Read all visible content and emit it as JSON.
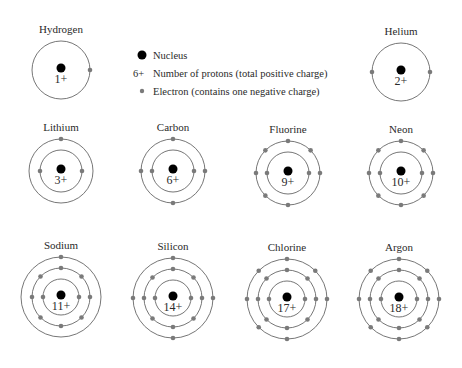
{
  "legend": {
    "items": [
      {
        "symbol": "nucleus",
        "text": "Nucleus"
      },
      {
        "symbol": "6+",
        "text": "Number of protons (total positive charge)"
      },
      {
        "symbol": "electron",
        "text": "Electron (contains one negative charge)"
      }
    ]
  },
  "colors": {
    "nucleus": "#000000",
    "electron": "#7a7a7a",
    "shell": "#666666",
    "text": "#2a2a2a"
  },
  "atoms": [
    {
      "name": "Hydrogen",
      "charge": "1+",
      "cx": 61,
      "cy": 70,
      "shells": [
        {
          "r": 29,
          "angles": [
            0
          ]
        }
      ]
    },
    {
      "name": "Helium",
      "charge": "2+",
      "cx": 401,
      "cy": 72,
      "shells": [
        {
          "r": 29,
          "angles": [
            0,
            180
          ]
        }
      ]
    },
    {
      "name": "Lithium",
      "charge": "3+",
      "cx": 61,
      "cy": 171,
      "shells": [
        {
          "r": 21,
          "angles": [
            0,
            180
          ]
        },
        {
          "r": 32,
          "angles": [
            270
          ]
        }
      ]
    },
    {
      "name": "Carbon",
      "charge": "6+",
      "cx": 173,
      "cy": 171,
      "shells": [
        {
          "r": 21,
          "angles": [
            0,
            180
          ]
        },
        {
          "r": 32,
          "angles": [
            0,
            90,
            180,
            270
          ]
        }
      ]
    },
    {
      "name": "Fluorine",
      "charge": "9+",
      "cx": 288,
      "cy": 173,
      "shells": [
        {
          "r": 21,
          "angles": [
            0,
            180
          ]
        },
        {
          "r": 32,
          "angles": [
            0,
            90,
            135,
            180,
            225,
            270,
            315
          ]
        }
      ]
    },
    {
      "name": "Neon",
      "charge": "10+",
      "cx": 401,
      "cy": 173,
      "shells": [
        {
          "r": 21,
          "angles": [
            0,
            180
          ]
        },
        {
          "r": 32,
          "angles": [
            0,
            45,
            90,
            135,
            180,
            225,
            270,
            315
          ]
        }
      ]
    },
    {
      "name": "Sodium",
      "charge": "11+",
      "cx": 61,
      "cy": 297,
      "shells": [
        {
          "r": 18,
          "angles": [
            0,
            180
          ]
        },
        {
          "r": 29,
          "angles": [
            0,
            45,
            90,
            135,
            180,
            225,
            270,
            315
          ]
        },
        {
          "r": 40,
          "angles": [
            270
          ]
        }
      ]
    },
    {
      "name": "Silicon",
      "charge": "14+",
      "cx": 173,
      "cy": 298,
      "shells": [
        {
          "r": 18,
          "angles": [
            0,
            180
          ]
        },
        {
          "r": 29,
          "angles": [
            0,
            45,
            90,
            135,
            180,
            225,
            270,
            315
          ]
        },
        {
          "r": 40,
          "angles": [
            0,
            90,
            180,
            270
          ]
        }
      ]
    },
    {
      "name": "Chlorine",
      "charge": "17+",
      "cx": 287,
      "cy": 299,
      "shells": [
        {
          "r": 18,
          "angles": [
            0,
            180
          ]
        },
        {
          "r": 29,
          "angles": [
            0,
            45,
            90,
            135,
            180,
            225,
            270,
            315
          ]
        },
        {
          "r": 40,
          "angles": [
            0,
            90,
            135,
            180,
            225,
            270,
            315
          ]
        }
      ]
    },
    {
      "name": "Argon",
      "charge": "18+",
      "cx": 399,
      "cy": 299,
      "shells": [
        {
          "r": 18,
          "angles": [
            0,
            180
          ]
        },
        {
          "r": 29,
          "angles": [
            0,
            45,
            90,
            135,
            180,
            225,
            270,
            315
          ]
        },
        {
          "r": 40,
          "angles": [
            0,
            45,
            90,
            135,
            180,
            225,
            270,
            315
          ]
        }
      ]
    }
  ]
}
